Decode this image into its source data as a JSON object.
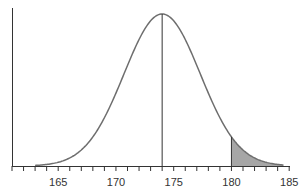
{
  "chart_data": {
    "type": "area",
    "title": "",
    "xlabel": "",
    "ylabel": "",
    "distribution": "normal",
    "mean": 174,
    "sd": 3.3,
    "xlim": [
      161,
      185
    ],
    "x_ticks_labeled": [
      165,
      170,
      175,
      180,
      185
    ],
    "x_ticks_minor_step": 1,
    "mean_line": 174,
    "shaded_region": {
      "from": 180,
      "to": 185,
      "color": "#a6a6a6"
    },
    "grid": false,
    "legend": null
  },
  "colors": {
    "curve": "#6e6e6e",
    "axis": "#333333",
    "shade": "#a6a6a6"
  },
  "tick_labels": [
    "165",
    "170",
    "175",
    "180",
    "185"
  ]
}
